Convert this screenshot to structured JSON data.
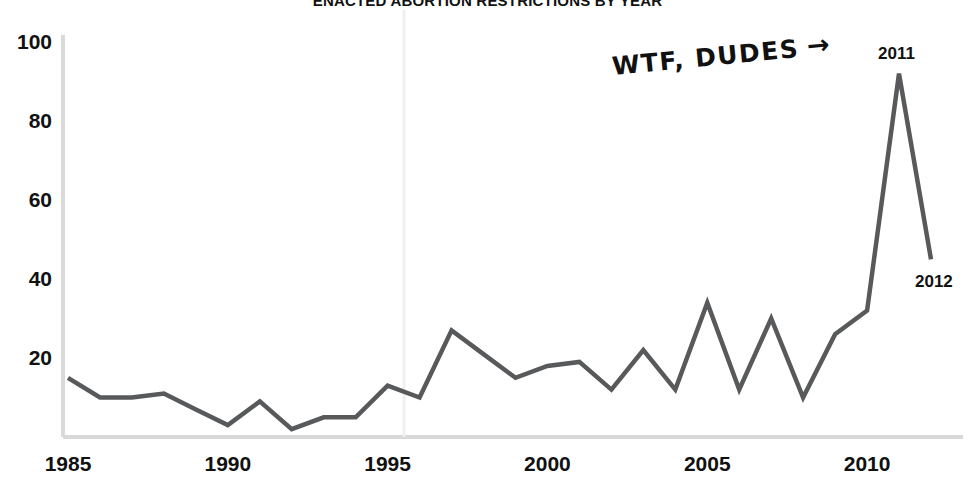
{
  "chart_data": {
    "type": "line",
    "title": "ENACTED ABORTION RESTRICTIONS BY YEAR",
    "xlabel": "",
    "ylabel": "",
    "xlim": [
      1985,
      2012
    ],
    "ylim": [
      0,
      100
    ],
    "grid": false,
    "legend": null,
    "line_color": "#58595b",
    "axis_color": "#d9d9d9",
    "x": [
      1985,
      1986,
      1987,
      1988,
      1989,
      1990,
      1991,
      1992,
      1993,
      1994,
      1995,
      1996,
      1997,
      1998,
      1999,
      2000,
      2001,
      2002,
      2003,
      2004,
      2005,
      2006,
      2007,
      2008,
      2009,
      2010,
      2011,
      2012
    ],
    "values": [
      15,
      10,
      10,
      11,
      7,
      3,
      9,
      2,
      5,
      5,
      13,
      10,
      27,
      21,
      15,
      18,
      19,
      12,
      22,
      12,
      34,
      12,
      30,
      10,
      26,
      32,
      92,
      45
    ],
    "xticks": [
      1985,
      1990,
      1995,
      2000,
      2005,
      2010
    ],
    "xticklabels": [
      "1985",
      "1990",
      "1995",
      "2000",
      "2005",
      "2010"
    ],
    "yticks": [
      20,
      40,
      60,
      80,
      100
    ],
    "yticklabels": [
      "20",
      "40",
      "60",
      "80",
      "100"
    ],
    "annotations": [
      {
        "text": "WTF, DUDES",
        "arrow": "→",
        "points_to": 2011,
        "style": "handwritten"
      }
    ],
    "point_labels": [
      {
        "year": "2011",
        "value": 92
      },
      {
        "year": "2012",
        "value": 45
      }
    ]
  }
}
